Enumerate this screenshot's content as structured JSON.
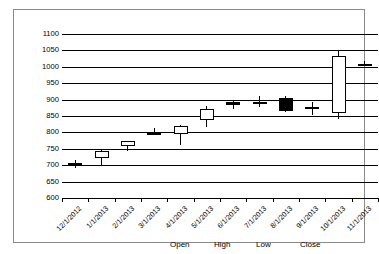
{
  "chart_data": {
    "type": "bar",
    "subtype": "candlestick",
    "title": "",
    "xlabel": "",
    "ylabel": "",
    "ylim": [
      600,
      1100
    ],
    "ytick_step": 50,
    "yticks": [
      "1100",
      "1050",
      "1000",
      "950",
      "900",
      "850",
      "800",
      "750",
      "700",
      "650",
      "600"
    ],
    "grid": true,
    "legend_position": "bottom-center",
    "legend": [
      "Open",
      "High",
      "Low",
      "Close"
    ],
    "categories": [
      "12/1/2012",
      "1/1/2013",
      "2/1/2013",
      "3/1/2013",
      "4/1/2013",
      "5/1/2013",
      "6/1/2013",
      "7/1/2013",
      "8/1/2013",
      "9/1/2013",
      "10/1/2013",
      "11/1/2013"
    ],
    "series": [
      {
        "name": "Open",
        "values": [
          706,
          722,
          760,
          800,
          795,
          838,
          888,
          893,
          905,
          878,
          860,
          1010
        ]
      },
      {
        "name": "High",
        "values": [
          716,
          748,
          772,
          812,
          822,
          880,
          898,
          912,
          910,
          893,
          1048,
          1018
        ]
      },
      {
        "name": "Low",
        "values": [
          690,
          700,
          742,
          797,
          762,
          815,
          872,
          878,
          862,
          852,
          840,
          1005
        ]
      },
      {
        "name": "Close",
        "values": [
          702,
          742,
          775,
          793,
          818,
          872,
          892,
          890,
          865,
          870,
          1032,
          1005
        ]
      }
    ],
    "points": [
      {
        "date": "12/1/2012",
        "open": 706,
        "high": 716,
        "low": 690,
        "close": 702,
        "direction": "down"
      },
      {
        "date": "1/1/2013",
        "open": 722,
        "high": 748,
        "low": 700,
        "close": 742,
        "direction": "up"
      },
      {
        "date": "2/1/2013",
        "open": 760,
        "high": 772,
        "low": 742,
        "close": 775,
        "direction": "up"
      },
      {
        "date": "3/1/2013",
        "open": 800,
        "high": 812,
        "low": 797,
        "close": 793,
        "direction": "down"
      },
      {
        "date": "4/1/2013",
        "open": 795,
        "high": 822,
        "low": 762,
        "close": 818,
        "direction": "up"
      },
      {
        "date": "5/1/2013",
        "open": 838,
        "high": 880,
        "low": 815,
        "close": 872,
        "direction": "up"
      },
      {
        "date": "6/1/2013",
        "open": 888,
        "high": 898,
        "low": 872,
        "close": 892,
        "direction": "down"
      },
      {
        "date": "7/1/2013",
        "open": 893,
        "high": 912,
        "low": 878,
        "close": 890,
        "direction": "up"
      },
      {
        "date": "8/1/2013",
        "open": 905,
        "high": 910,
        "low": 862,
        "close": 865,
        "direction": "down"
      },
      {
        "date": "9/1/2013",
        "open": 878,
        "high": 893,
        "low": 852,
        "close": 870,
        "direction": "up"
      },
      {
        "date": "10/1/2013",
        "open": 860,
        "high": 1048,
        "low": 840,
        "close": 1032,
        "direction": "up"
      },
      {
        "date": "11/1/2013",
        "open": 1010,
        "high": 1018,
        "low": 1005,
        "close": 1005,
        "direction": "down"
      }
    ],
    "colors": {
      "up_body": "#ffffff",
      "down_body": "#000000",
      "outline": "#000000",
      "gridline": "#000000",
      "frame": "#8a8a8a"
    }
  }
}
